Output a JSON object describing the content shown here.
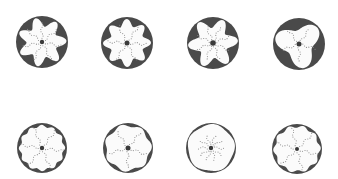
{
  "figure": {
    "background": "#ffffff",
    "ring_color": "#4a4a4a",
    "inner_color": "#fbfbfb",
    "dot_color": "#8a8a8a",
    "center_color": "#3a3a3a",
    "panels": [
      {
        "id": "top-1",
        "cx": 42,
        "cy": 42,
        "r": 26,
        "lobes": 7,
        "lobe_depth": 4.5,
        "inner_r": 20,
        "arms": 7,
        "arm_len": 17,
        "center_r": 2.2,
        "phase": 0.3
      },
      {
        "id": "top-2",
        "cx": 127,
        "cy": 43,
        "r": 26,
        "lobes": 8,
        "lobe_depth": 3.5,
        "inner_r": 20.5,
        "arms": 6,
        "arm_len": 18,
        "center_r": 2.5,
        "phase": 0.1
      },
      {
        "id": "top-3",
        "cx": 213,
        "cy": 43,
        "r": 26,
        "lobes": 6,
        "lobe_depth": 5,
        "inner_r": 20,
        "arms": 8,
        "arm_len": 16,
        "center_r": 2.8,
        "phase": 0.6
      },
      {
        "id": "top-4",
        "cx": 299,
        "cy": 44,
        "r": 26,
        "lobes": 3,
        "lobe_depth": 5.5,
        "inner_r": 19,
        "arms": 5,
        "arm_len": 16,
        "center_r": 2.5,
        "phase": 2.2
      },
      {
        "id": "bottom-1",
        "cx": 42,
        "cy": 148,
        "r": 25,
        "lobes": 12,
        "lobe_depth": 1.2,
        "inner_r": 22,
        "arms": 6,
        "arm_len": 19,
        "center_r": 2.2,
        "phase": 0.2
      },
      {
        "id": "bottom-2",
        "cx": 128,
        "cy": 148,
        "r": 25,
        "lobes": 7,
        "lobe_depth": 1.4,
        "inner_r": 22.5,
        "arms": 5,
        "arm_len": 17,
        "center_r": 2.5,
        "phase": 0.5
      },
      {
        "id": "bottom-3",
        "cx": 211,
        "cy": 148,
        "r": 25,
        "lobes": 5,
        "lobe_depth": 0.8,
        "inner_r": 23.3,
        "arms": 10,
        "arm_len": 12,
        "center_r": 2.2,
        "phase": 0.9
      },
      {
        "id": "bottom-4",
        "cx": 297,
        "cy": 149,
        "r": 25,
        "lobes": 10,
        "lobe_depth": 1.3,
        "inner_r": 22.5,
        "arms": 6,
        "arm_len": 19,
        "center_r": 2.0,
        "phase": 0.4
      }
    ]
  }
}
